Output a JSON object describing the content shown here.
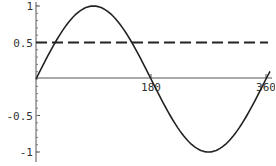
{
  "chart_data": {
    "type": "line",
    "title": "",
    "xlabel": "",
    "ylabel": "",
    "xlim": [
      0,
      360
    ],
    "ylim": [
      -1,
      1
    ],
    "grid": false,
    "legend": null,
    "x_ticks": [
      180,
      360
    ],
    "x_tick_labels": [
      "180",
      "360"
    ],
    "y_ticks": [
      1,
      0.5,
      -0.5,
      -1
    ],
    "y_tick_labels": [
      "1",
      "0.5",
      "-0.5",
      "-1"
    ],
    "series": [
      {
        "name": "sin(x)",
        "style": "solid",
        "color": "#222222",
        "x": [
          0,
          30,
          60,
          90,
          120,
          150,
          180,
          210,
          240,
          270,
          300,
          330,
          360
        ],
        "values": [
          0,
          0.5,
          0.866,
          1,
          0.866,
          0.5,
          0,
          -0.5,
          -0.866,
          -1,
          -0.866,
          -0.5,
          0
        ]
      },
      {
        "name": "y = 0.5",
        "style": "dashed",
        "color": "#222222",
        "x": [
          0,
          360
        ],
        "values": [
          0.5,
          0.5
        ]
      }
    ]
  },
  "axes": {
    "x_tick_labels": [
      "180",
      "360"
    ],
    "y_tick_labels": [
      "1",
      "0.5",
      "-0.5",
      "-1"
    ]
  }
}
